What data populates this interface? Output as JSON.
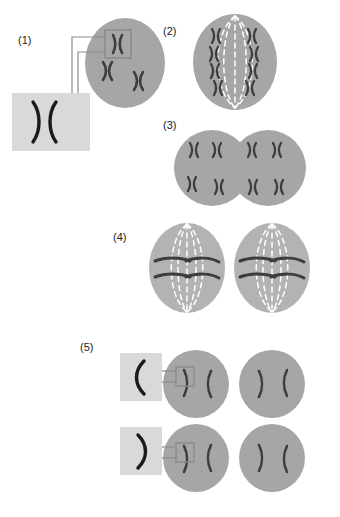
{
  "figure": {
    "title": "",
    "background": "#ffffff",
    "colors": {
      "cell": "#a6a6a6",
      "cell_stage4": "#b3b3b3",
      "chromosome_dark": "#3d3d3d",
      "chromosome_black": "#1a1a1a",
      "spindle": "#ffffff",
      "callout_box_fill": "#d9d9d9",
      "callout_line": "#808080",
      "label_text": "#1a1a1a"
    },
    "stages": [
      {
        "id": "stage-1",
        "label": "(1)",
        "label_x": 18,
        "label_y": 40,
        "description": "Single cell with paired chromosomes, magnified inset of one chromosome pair"
      },
      {
        "id": "stage-2",
        "label": "(2)",
        "label_x": 163,
        "label_y": 32,
        "description": "Cell with spindle fibers and chromosomes aligned at the metaphase plate"
      },
      {
        "id": "stage-3",
        "label": "(3)",
        "label_x": 163,
        "label_y": 126,
        "description": "Two joined daughter cells each containing chromosomes"
      },
      {
        "id": "stage-4",
        "label": "(4)",
        "label_x": 113,
        "label_y": 238,
        "description": "Two cells each with spindle fibers and chromosomes aligned at the equator"
      },
      {
        "id": "stage-5",
        "label": "(5)",
        "label_x": 80,
        "label_y": 347,
        "description": "Four resulting cells with single chromatids, two magnified insets"
      }
    ],
    "callouts": [
      {
        "id": "callout-1",
        "stage": "(1)",
        "content": "chromosome-pair-magnified",
        "box_x": 12,
        "box_y": 92,
        "box_w": 78,
        "box_h": 58
      },
      {
        "id": "callout-5-upper",
        "stage": "(5)",
        "content": "single-chromatid-left-curve",
        "box_x": 120,
        "box_y": 352,
        "box_w": 42,
        "box_h": 48
      },
      {
        "id": "callout-5-lower",
        "stage": "(5)",
        "content": "single-chromatid-right-curve",
        "box_x": 120,
        "box_y": 426,
        "box_w": 42,
        "box_h": 48
      }
    ]
  }
}
